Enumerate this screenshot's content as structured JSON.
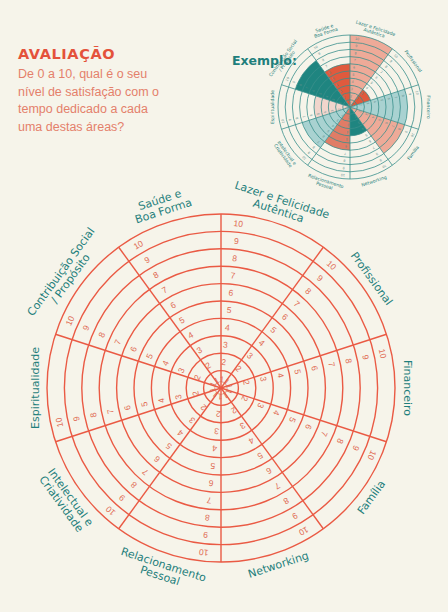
{
  "header": {
    "title": "AVALIAÇÃO",
    "question": "De 0 a 10, qual é o seu nível de satisfação com o tempo dedicado a cada uma destas áreas?"
  },
  "example": {
    "label": "Exemplo:"
  },
  "colors": {
    "background": "#f6f4ea",
    "accent_red": "#e4523b",
    "text_salmon": "#e4806a",
    "label_teal": "#1f7f7c",
    "wheel_line": "#ea5a44",
    "example_line": "#3a8f8b",
    "fill_salmon_light": "#eeaa98",
    "fill_red": "#e05a3e",
    "fill_teal_light": "#a9d2d1",
    "fill_teal_dark": "#1f8580",
    "fill_salmon_med": "#e07c66",
    "fill_pink_pale": "#f1d5cc"
  },
  "chart_data": [
    {
      "type": "wheel",
      "title": "Roda da Vida (blank)",
      "scale": [
        1,
        2,
        3,
        4,
        5,
        6,
        7,
        8,
        9,
        10
      ],
      "categories": [
        "Lazer e Felicidade Autêntica",
        "Profissional",
        "Financeiro",
        "Família",
        "Networking",
        "Relacionamento Pessoal",
        "Intelectual e Criatividade",
        "Espiritualidade",
        "Contribuição Social / Propósito",
        "Saúde e Boa Forma"
      ]
    },
    {
      "type": "wheel",
      "title": "Exemplo",
      "categories": [
        "Lazer e Felicidade Autêntica",
        "Profissional",
        "Financeiro",
        "Família",
        "Networking",
        "Relacionamento Pessoal",
        "Intelectual e Criatividade",
        "Espiritualidade",
        "Contribuição Social / Propósito",
        "Saúde e Boa Forma"
      ],
      "values": [
        10,
        3,
        8,
        8,
        4,
        6,
        7,
        5,
        8,
        6
      ],
      "fills": [
        "#eeaa98",
        "#e05a3e",
        "#a9d2d1",
        "#eeaa98",
        "#1f8580",
        "#e07c66",
        "#a9d2d1",
        "#f1d5cc",
        "#1f8580",
        "#e05a3e"
      ],
      "ylim": [
        0,
        10
      ]
    }
  ],
  "wheel": {
    "labels": [
      {
        "lines": [
          "Lazer e Felicidade",
          "Autêntica"
        ]
      },
      {
        "lines": [
          "Profissional"
        ]
      },
      {
        "lines": [
          "Financeiro"
        ]
      },
      {
        "lines": [
          "Família"
        ]
      },
      {
        "lines": [
          "Networking"
        ]
      },
      {
        "lines": [
          "Relacionamento",
          "Pessoal"
        ]
      },
      {
        "lines": [
          "Intelectual e",
          "Criatividade"
        ]
      },
      {
        "lines": [
          "Espiritualidade"
        ]
      },
      {
        "lines": [
          "Contribuição Social",
          "/ Propósito"
        ]
      },
      {
        "lines": [
          "Saúde e",
          "Boa Forma"
        ]
      }
    ]
  }
}
